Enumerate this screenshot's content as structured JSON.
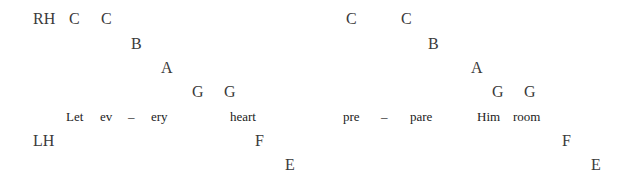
{
  "labels": {
    "right_hand": "RH",
    "left_hand": "LH"
  },
  "right_hand_notes": [
    {
      "name": "C",
      "x": 69,
      "y": 11
    },
    {
      "name": "C",
      "x": 101,
      "y": 11
    },
    {
      "name": "B",
      "x": 131,
      "y": 36
    },
    {
      "name": "A",
      "x": 161,
      "y": 60
    },
    {
      "name": "G",
      "x": 192,
      "y": 84
    },
    {
      "name": "G",
      "x": 224,
      "y": 84
    },
    {
      "name": "C",
      "x": 346,
      "y": 11
    },
    {
      "name": "C",
      "x": 401,
      "y": 11
    },
    {
      "name": "B",
      "x": 428,
      "y": 36
    },
    {
      "name": "A",
      "x": 471,
      "y": 60
    },
    {
      "name": "G",
      "x": 492,
      "y": 84
    },
    {
      "name": "G",
      "x": 524,
      "y": 84
    }
  ],
  "lyrics": [
    {
      "text": "Let",
      "x": 66
    },
    {
      "text": "ev",
      "x": 100
    },
    {
      "text": "–",
      "x": 128
    },
    {
      "text": "ery",
      "x": 151
    },
    {
      "text": "heart",
      "x": 230
    },
    {
      "text": "pre",
      "x": 343
    },
    {
      "text": "–",
      "x": 381
    },
    {
      "text": "pare",
      "x": 410
    },
    {
      "text": "Him",
      "x": 477
    },
    {
      "text": "room",
      "x": 513
    }
  ],
  "left_hand_notes": [
    {
      "name": "F",
      "x": 255,
      "y": 133
    },
    {
      "name": "E",
      "x": 285,
      "y": 157
    },
    {
      "name": "F",
      "x": 562,
      "y": 133
    },
    {
      "name": "E",
      "x": 591,
      "y": 157
    }
  ]
}
